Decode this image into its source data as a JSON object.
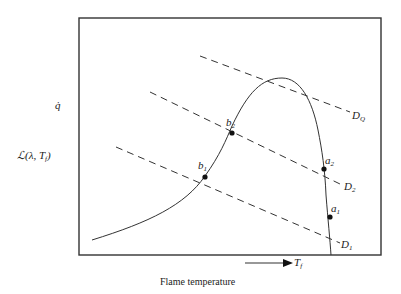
{
  "figure": {
    "y_labels": {
      "q_dot": "q̇",
      "loss": "ℒ(λ, T",
      "loss_sub": "f",
      "loss_close": ")"
    },
    "x_axis": {
      "arrow_label": "T",
      "arrow_label_sub": "f",
      "caption": "Flame temperature"
    },
    "points": [
      {
        "id": "b2",
        "label": "b",
        "sub": "2"
      },
      {
        "id": "b1",
        "label": "b",
        "sub": "1"
      },
      {
        "id": "a2",
        "label": "a",
        "sub": "2"
      },
      {
        "id": "a1",
        "label": "a",
        "sub": "1"
      }
    ],
    "lines": [
      {
        "id": "DQ",
        "label": "D",
        "sub": "Q"
      },
      {
        "id": "D2",
        "label": "D",
        "sub": "2"
      },
      {
        "id": "D1",
        "label": "D",
        "sub": "1"
      }
    ],
    "colors": {
      "ink": "#222222",
      "background": "#ffffff"
    }
  }
}
